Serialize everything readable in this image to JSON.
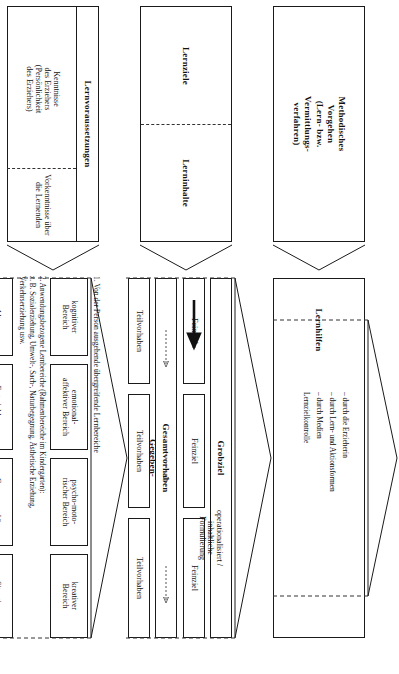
{
  "diagram": {
    "title_top_headers": [
      {
        "id": "gegebenheiten",
        "label": "Gegeben-\nheiten"
      },
      {
        "id": "didaktik",
        "label": "Didaktik"
      },
      {
        "id": "methodik",
        "label": "Methodik"
      }
    ],
    "section_gegebenheiten": {
      "bracket_label": "Gegeben-\nheiten",
      "note_line1": "1. Von der Person ausgehende übergreifende Lernbereiche",
      "note_line2": "2. Anwendungsbezogene Lernbereiche (Rahmenbereiche im Kindergarten):",
      "note_line3": "z. B. Sozialerziehung, Umwelt-, Sach-, Naturbegegnung, Ästhetische Erziehung,",
      "note_line4": "Verkehrserziehung usw.",
      "row_top": [
        {
          "id": "kognitiver-bereich",
          "label": "kognitiver\nBereich"
        },
        {
          "id": "emotional-affektiver-bereich",
          "label": "emotional-\naffektiver Bereich"
        },
        {
          "id": "psycho-motorischer-bereich",
          "label": "psycho-moto-\nrischer Bereich"
        },
        {
          "id": "kreativer-bereich",
          "label": "kreativer\nBereich"
        }
      ],
      "row_bottom": [
        {
          "id": "alter",
          "label": "Alter"
        },
        {
          "id": "entwicklung",
          "label": "Entwicklung"
        },
        {
          "id": "gruppengroesse",
          "label": "Gruppengröße"
        },
        {
          "id": "situation",
          "label": "Situation"
        }
      ],
      "left_panel": {
        "header": "Lernvoraussetzungen",
        "upper_text": "Kenntnisse\ndes Erziehers\n(Persönlichkeit\ndes Erziehers)",
        "lower_text": "Vorkenntnisse über\ndie Lernenden"
      }
    },
    "section_didaktik": {
      "bracket_label": "Didaktik",
      "note": "operationalisiert /\ninhaltliche\nFormulierung",
      "grobziel": "Grobziel",
      "feinziele": [
        {
          "id": "feinziel-1",
          "label": "Feinziel"
        },
        {
          "id": "feinziel-2",
          "label": "Feinziel"
        },
        {
          "id": "feinziel-3",
          "label": "Feinziel"
        }
      ],
      "gesamtvorhaben": "Gesamtvorhaben",
      "teilvorhaben": [
        {
          "id": "teilvorhaben-1",
          "label": "Teilvorhaben"
        },
        {
          "id": "teilvorhaben-2",
          "label": "Teilvorhaben"
        },
        {
          "id": "teilvorhaben-3",
          "label": "Teilvorhaben"
        }
      ],
      "left_panel": {
        "upper_label": "Lernziele",
        "lower_label": "Lerninhalte"
      }
    },
    "section_methodik": {
      "bracket_label": "Methodik",
      "lernhilfen_label": "Lernhilfen",
      "lernhilfen_items": [
        "– durch die  Erzieherin",
        "– durch Lern- und Aktionsformen",
        "– durch Medien",
        "   Lernzielkontrolle"
      ],
      "left_panel": {
        "label": "Methodisches\nVorgehen\n(Lern- bzw.\nVermittlungs-\nverfahren)"
      }
    },
    "colors": {
      "stroke": "#1a1a1a",
      "dashed": "#333333",
      "background": "#ffffff",
      "arrow": "#111111"
    }
  }
}
